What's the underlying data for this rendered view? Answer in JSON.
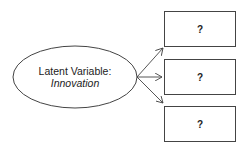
{
  "latent": {
    "line1": "Latent Variable:",
    "line2": "Innovation"
  },
  "indicators": [
    {
      "label": "?"
    },
    {
      "label": "?"
    },
    {
      "label": "?"
    }
  ],
  "colors": {
    "stroke": "#444444",
    "text": "#222222",
    "background": "#ffffff"
  }
}
